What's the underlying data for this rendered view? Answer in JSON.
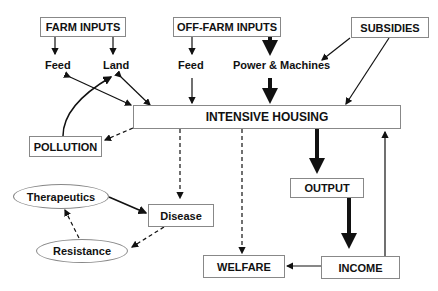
{
  "nodes": {
    "farm_inputs": "FARM INPUTS",
    "off_farm_inputs": "OFF-FARM INPUTS",
    "subsidies": "SUBSIDIES",
    "feed_farm": "Feed",
    "land": "Land",
    "feed_off": "Feed",
    "power_machines": "Power & Machines",
    "intensive_housing": "INTENSIVE HOUSING",
    "pollution": "POLLUTION",
    "output": "OUTPUT",
    "therapeutics": "Therapeutics",
    "disease": "Disease",
    "resistance": "Resistance",
    "welfare": "WELFARE",
    "income": "INCOME"
  }
}
